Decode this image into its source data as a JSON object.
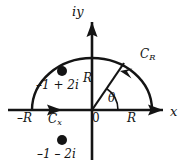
{
  "figure": {
    "type": "complex-plane-contour-diagram",
    "background_color": "#ffffff",
    "stroke_color": "#141414",
    "width": 183,
    "height": 168
  },
  "axes": {
    "vertical_label": "iy",
    "horizontal_label": "x",
    "origin_label": "0",
    "origin_px": {
      "x": 92,
      "y": 110
    }
  },
  "contour": {
    "arc_label": "C",
    "arc_subscript": "R",
    "segment_label": "C",
    "segment_subscript": "x",
    "radius_label": "R",
    "angle_label": "θ",
    "right_endpoint_label": "R",
    "left_endpoint_label": "–R",
    "radius_px": 60,
    "arc_span_degrees": [
      0,
      180
    ],
    "direction": "counterclockwise"
  },
  "poles": [
    {
      "label": "–1 + 2i",
      "position_px": {
        "x": 62,
        "y": 71
      },
      "inside_contour": true
    },
    {
      "label": "–1 – 2i",
      "position_px": {
        "x": 62,
        "y": 140
      },
      "inside_contour": false
    }
  ]
}
